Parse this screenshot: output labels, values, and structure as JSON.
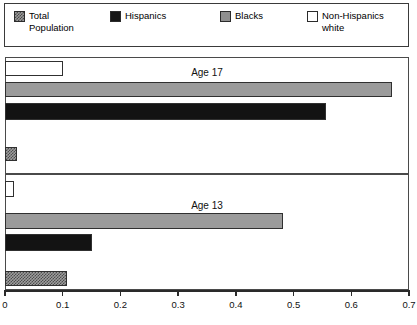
{
  "legend": {
    "items": [
      {
        "key": "total",
        "label": "Total\nPopulation",
        "swatch": "checkered-swatch",
        "color": "#9a9a9a"
      },
      {
        "key": "hispanics",
        "label": "Hispanics",
        "swatch": "solid-black-swatch",
        "color": "#161616"
      },
      {
        "key": "blacks",
        "label": "Blacks",
        "swatch": "solid-gray-swatch",
        "color": "#8f8f8f"
      },
      {
        "key": "nonhispanic_white",
        "label": "Non-Hispanics\nwhite",
        "swatch": "empty-white-swatch",
        "color": "#ffffff"
      }
    ]
  },
  "panels": [
    {
      "key": "age17",
      "title": "Age 17"
    },
    {
      "key": "age13",
      "title": "Age 13"
    }
  ],
  "axis": {
    "min": 0,
    "max": 0.7,
    "ticks": [
      "0",
      "0.1",
      "0.2",
      "0.3",
      "0.4",
      "0.5",
      "0.6",
      "0.7"
    ],
    "tick_values": [
      0,
      0.1,
      0.2,
      0.3,
      0.4,
      0.5,
      0.6,
      0.7
    ]
  },
  "chart_data": {
    "type": "bar",
    "orientation": "horizontal",
    "title": "",
    "xlabel": "",
    "ylabel": "",
    "xlim": [
      0,
      0.7
    ],
    "grid": false,
    "legend_position": "top",
    "categories": [
      "Age 17",
      "Age 13"
    ],
    "series": [
      {
        "name": "Non-Hispanics white",
        "values": [
          0.1,
          0.015
        ]
      },
      {
        "name": "Blacks",
        "values": [
          0.671,
          0.482
        ]
      },
      {
        "name": "Hispanics",
        "values": [
          0.556,
          0.151
        ]
      },
      {
        "name": "Total Population",
        "values": [
          0.021,
          0.107
        ]
      }
    ],
    "panels": [
      {
        "label": "Age 17",
        "bars": [
          {
            "series": "Non-Hispanics white",
            "value": 0.1
          },
          {
            "series": "Blacks",
            "value": 0.671
          },
          {
            "series": "Hispanics",
            "value": 0.556
          },
          {
            "series": "Total Population",
            "value": 0.021
          }
        ]
      },
      {
        "label": "Age 13",
        "bars": [
          {
            "series": "Non-Hispanics white",
            "value": 0.015
          },
          {
            "series": "Blacks",
            "value": 0.482
          },
          {
            "series": "Hispanics",
            "value": 0.151
          },
          {
            "series": "Total Population",
            "value": 0.107
          }
        ]
      }
    ]
  }
}
